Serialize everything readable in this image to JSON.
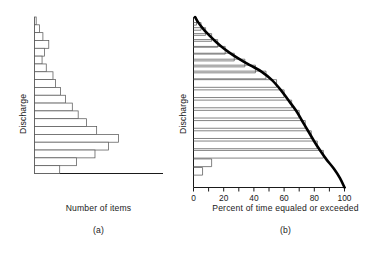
{
  "figure": {
    "panel_a": {
      "id": "(a)",
      "xlabel": "Number of items",
      "ylabel": "Discharge"
    },
    "panel_b": {
      "id": "(b)",
      "xlabel": "Percent of time equaled or exceeded",
      "ylabel": "Discharge",
      "xticklabels": [
        "0",
        "20",
        "40",
        "60",
        "80",
        "100"
      ]
    },
    "colors": {
      "axis": "#1a1a1a",
      "bar_stroke": "#5a5a5a",
      "bar_fill": "#ffffff",
      "curve": "#000000",
      "background": "#ffffff"
    }
  },
  "chart_data": [
    {
      "type": "bar",
      "orientation": "horizontal",
      "title": "",
      "panel": "(a)",
      "xlabel": "Number of items",
      "ylabel": "Discharge",
      "xlim": [
        0,
        100
      ],
      "ylim": [
        0,
        20
      ],
      "grid": false,
      "legend": null,
      "categories": [
        "c20",
        "c19",
        "c18",
        "c17",
        "c16",
        "c15",
        "c14",
        "c13",
        "c12",
        "c11",
        "c10",
        "c9",
        "c8",
        "c7",
        "c6",
        "c5",
        "c4",
        "c3",
        "c2",
        "c1"
      ],
      "values": [
        2,
        6,
        10,
        17,
        12,
        9,
        14,
        22,
        25,
        31,
        37,
        45,
        52,
        62,
        74,
        100,
        88,
        72,
        50,
        30
      ],
      "note": "Bars ordered top (highest discharge) to bottom (lowest discharge); values are relative counts of items per discharge class."
    },
    {
      "type": "line",
      "panel": "(b)",
      "title": "",
      "xlabel": "Percent of time equaled or exceeded",
      "ylabel": "Discharge",
      "xlim": [
        0,
        100
      ],
      "ylim": [
        0,
        20
      ],
      "xticks": [
        0,
        10,
        20,
        30,
        40,
        50,
        60,
        70,
        80,
        90,
        100
      ],
      "xticklabels": [
        "0",
        "20",
        "40",
        "60",
        "80",
        "100"
      ],
      "grid": false,
      "legend": null,
      "series": [
        {
          "name": "Flow duration curve",
          "x": [
            1,
            3,
            6,
            9,
            13,
            18,
            24,
            31,
            38,
            45,
            52,
            58,
            63,
            68,
            72,
            76,
            80,
            84,
            88,
            93,
            97,
            100
          ],
          "y": [
            20,
            19.4,
            18.7,
            18.1,
            17.4,
            16.6,
            15.8,
            15.0,
            14.3,
            13.6,
            12.6,
            11.4,
            10.2,
            9.0,
            7.8,
            6.6,
            5.4,
            4.3,
            3.3,
            2.2,
            1.1,
            0
          ]
        },
        {
          "name": "Cumulative step bars",
          "step_x": [
            2,
            5,
            8,
            12,
            16,
            21,
            27,
            34,
            41,
            48,
            55,
            60,
            65,
            70,
            74,
            78,
            82,
            86,
            12,
            6
          ],
          "step_y": [
            19.5,
            18.9,
            18.3,
            17.6,
            16.9,
            16.1,
            15.3,
            14.6,
            13.9,
            13.2,
            12.2,
            11.0,
            9.8,
            8.6,
            7.4,
            6.2,
            5.0,
            3.9,
            2.9,
            1.9
          ]
        }
      ],
      "note": "Cumulative (exceedance) distribution derived from panel (a); smooth heavy curve is the fitted flow duration curve."
    }
  ]
}
